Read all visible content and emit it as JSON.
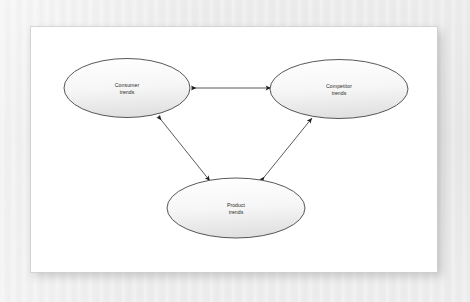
{
  "figure": {
    "type": "relationship-diagram",
    "page_background": "#ffffff",
    "canvas_background": "#ececec",
    "node_outline_color": "#3a3a3a",
    "node_fill_top": "#ffffff",
    "node_fill_bottom": "#e3e3e3",
    "edge_color": "#2e2e2e",
    "label_color": "#2b2b2b",
    "nodes": [
      {
        "id": "consumer-trends",
        "line1": "Consumer",
        "line2": "trends",
        "cx": 127,
        "cy": 88,
        "rx": 63,
        "ry": 29.5
      },
      {
        "id": "competitor-trends",
        "line1": "Competitor",
        "line2": "trends",
        "cx": 339,
        "cy": 89,
        "rx": 69,
        "ry": 29.5
      },
      {
        "id": "product-trends",
        "line1": "Product",
        "line2": "trends",
        "cx": 236,
        "cy": 208,
        "rx": 69,
        "ry": 30
      }
    ],
    "edges": [
      {
        "id": "consumer-competitor",
        "from": "consumer-trends",
        "to": "competitor-trends",
        "arrow": "double",
        "x1": 191,
        "y1": 88,
        "x2": 271,
        "y2": 88
      },
      {
        "id": "consumer-product",
        "from": "consumer-trends",
        "to": "product-trends",
        "arrow": "double",
        "x1": 158,
        "y1": 116,
        "x2": 210,
        "y2": 181
      },
      {
        "id": "product-competitor",
        "from": "product-trends",
        "to": "competitor-trends",
        "arrow": "double",
        "x1": 261,
        "y1": 181,
        "x2": 312,
        "y2": 118
      }
    ]
  }
}
